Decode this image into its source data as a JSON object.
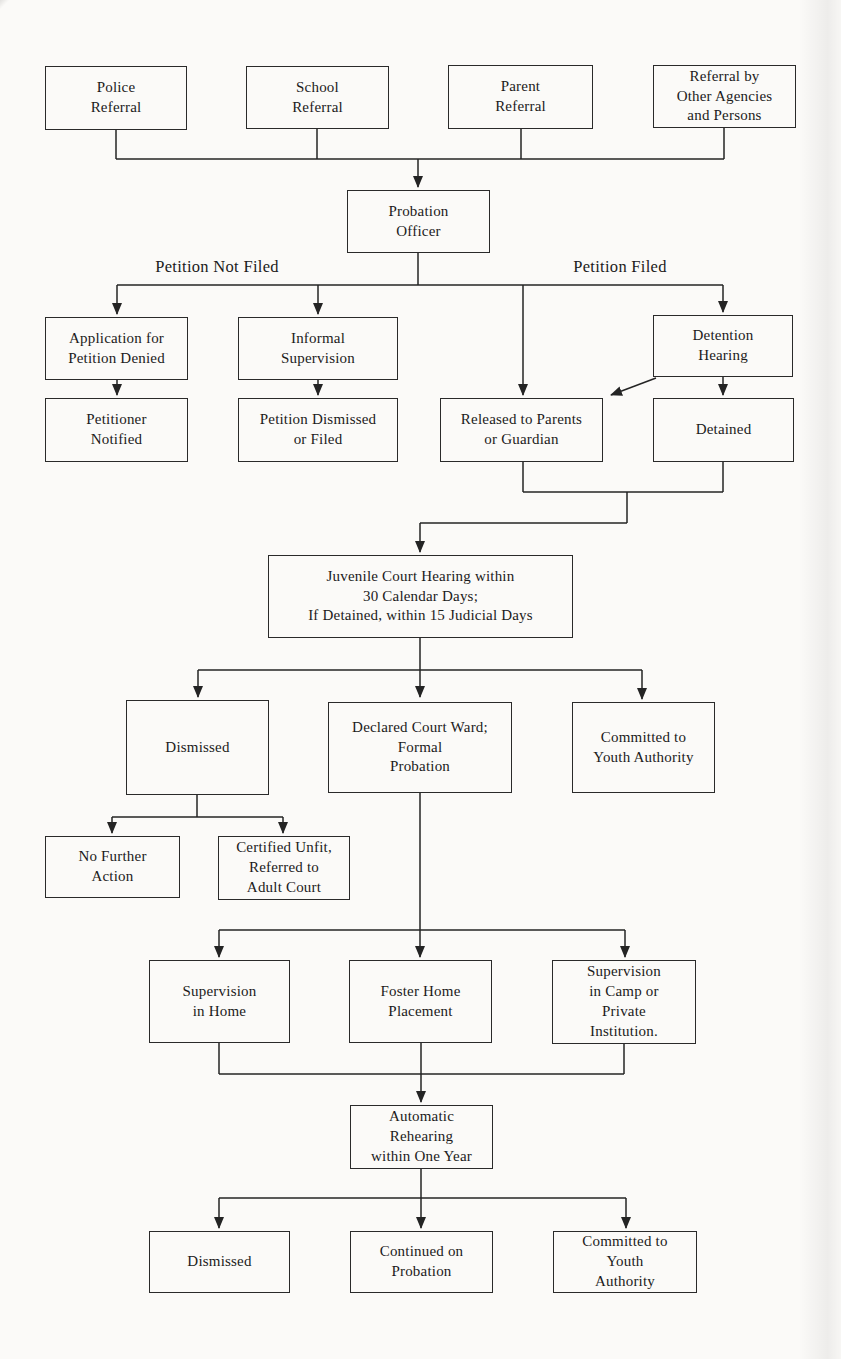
{
  "page": {
    "background": "#fbfaf8",
    "ink": "#242424",
    "diagram_type": "flowchart"
  },
  "branch_labels": {
    "left": "Petition Not Filed",
    "right": "Petition Filed"
  },
  "nodes": {
    "police": {
      "label": [
        "Police",
        "Referral"
      ]
    },
    "school": {
      "label": [
        "School",
        "Referral"
      ]
    },
    "parent": {
      "label": [
        "Parent",
        "Referral"
      ]
    },
    "agencies": {
      "label": [
        "Referral by",
        "Other Agencies",
        "and Persons"
      ]
    },
    "probation": {
      "label": [
        "Probation",
        "Officer"
      ]
    },
    "application_denied": {
      "label": [
        "Application for",
        "Petition Denied"
      ]
    },
    "informal_supervision": {
      "label": [
        "Informal",
        "Supervision"
      ]
    },
    "detention_hearing": {
      "label": [
        "Detention",
        "Hearing"
      ]
    },
    "petitioner_notified": {
      "label": [
        "Petitioner",
        "Notified"
      ]
    },
    "petition_dismissed_or_filed": {
      "label": [
        "Petition Dismissed",
        "or Filed"
      ]
    },
    "released_to_parents": {
      "label": [
        "Released to Parents",
        "or Guardian"
      ]
    },
    "detained": {
      "label": [
        "Detained"
      ]
    },
    "juvenile_court_hearing": {
      "label": [
        "Juvenile Court Hearing within",
        "30 Calendar Days;",
        "If Detained, within 15 Judicial Days"
      ]
    },
    "dismissed_court": {
      "label": [
        "Dismissed"
      ]
    },
    "declared_ward": {
      "label": [
        "Declared Court Ward;",
        "Formal",
        "Probation"
      ]
    },
    "committed_youth_authority": {
      "label": [
        "Committed to",
        "Youth Authority"
      ]
    },
    "no_further_action": {
      "label": [
        "No Further",
        "Action"
      ]
    },
    "certified_unfit": {
      "label": [
        "Certified Unfit,",
        "Referred to",
        "Adult Court"
      ]
    },
    "supervision_in_home": {
      "label": [
        "Supervision",
        "in Home"
      ]
    },
    "foster_home": {
      "label": [
        "Foster Home",
        "Placement"
      ]
    },
    "camp_private": {
      "label": [
        "Supervision",
        "in Camp or",
        "Private",
        "Institution."
      ]
    },
    "automatic_rehearing": {
      "label": [
        "Automatic",
        "Rehearing",
        "within One Year"
      ]
    },
    "dismissed_rehearing": {
      "label": [
        "Dismissed"
      ]
    },
    "continued_probation": {
      "label": [
        "Continued on",
        "Probation"
      ]
    },
    "committed_youth_authority_2": {
      "label": [
        "Committed to",
        "Youth",
        "Authority"
      ]
    }
  },
  "edges": [
    {
      "from": "police",
      "to": "probation"
    },
    {
      "from": "school",
      "to": "probation"
    },
    {
      "from": "parent",
      "to": "probation"
    },
    {
      "from": "agencies",
      "to": "probation"
    },
    {
      "from": "probation",
      "to": "application_denied",
      "label": "Petition Not Filed"
    },
    {
      "from": "probation",
      "to": "informal_supervision",
      "label": "Petition Not Filed"
    },
    {
      "from": "probation",
      "to": "released_to_parents",
      "label": "Petition Filed"
    },
    {
      "from": "probation",
      "to": "detention_hearing",
      "label": "Petition Filed"
    },
    {
      "from": "application_denied",
      "to": "petitioner_notified"
    },
    {
      "from": "informal_supervision",
      "to": "petition_dismissed_or_filed"
    },
    {
      "from": "detention_hearing",
      "to": "released_to_parents"
    },
    {
      "from": "detention_hearing",
      "to": "detained"
    },
    {
      "from": "released_to_parents",
      "to": "juvenile_court_hearing"
    },
    {
      "from": "detained",
      "to": "juvenile_court_hearing"
    },
    {
      "from": "juvenile_court_hearing",
      "to": "dismissed_court"
    },
    {
      "from": "juvenile_court_hearing",
      "to": "declared_ward"
    },
    {
      "from": "juvenile_court_hearing",
      "to": "committed_youth_authority"
    },
    {
      "from": "dismissed_court",
      "to": "no_further_action"
    },
    {
      "from": "dismissed_court",
      "to": "certified_unfit"
    },
    {
      "from": "declared_ward",
      "to": "supervision_in_home"
    },
    {
      "from": "declared_ward",
      "to": "foster_home"
    },
    {
      "from": "declared_ward",
      "to": "camp_private"
    },
    {
      "from": "supervision_in_home",
      "to": "automatic_rehearing"
    },
    {
      "from": "foster_home",
      "to": "automatic_rehearing"
    },
    {
      "from": "camp_private",
      "to": "automatic_rehearing"
    },
    {
      "from": "automatic_rehearing",
      "to": "dismissed_rehearing"
    },
    {
      "from": "automatic_rehearing",
      "to": "continued_probation"
    },
    {
      "from": "automatic_rehearing",
      "to": "committed_youth_authority_2"
    }
  ]
}
